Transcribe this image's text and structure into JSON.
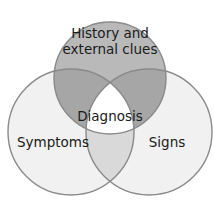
{
  "diagram": {
    "type": "venn-3-circle",
    "background_color": "#ffffff",
    "stroke_color": "#8a8a8a",
    "text_color": "#1a1a1a",
    "sets": [
      {
        "id": "history",
        "label_line_1": "History and",
        "label_line_2": "external clues",
        "fill_color": "#b9b9b9",
        "position": "top",
        "cx": 110,
        "cy": 78,
        "r": 56
      },
      {
        "id": "symptoms",
        "label_line_1": "Symptoms",
        "fill_color": "#f1f1f1",
        "position": "bottom-left",
        "cx": 71,
        "cy": 132,
        "r": 63
      },
      {
        "id": "signs",
        "label_line_1": "Signs",
        "fill_color": "#f1f1f1",
        "position": "bottom-right",
        "cx": 149,
        "cy": 132,
        "r": 63
      }
    ],
    "intersections": {
      "pairwise_fill_color": "#a6a6a6",
      "pairwise_light_fill_color": "#d9d9d9",
      "center_label": "Diagnosis",
      "center_fill_color": "#ffffff"
    }
  }
}
